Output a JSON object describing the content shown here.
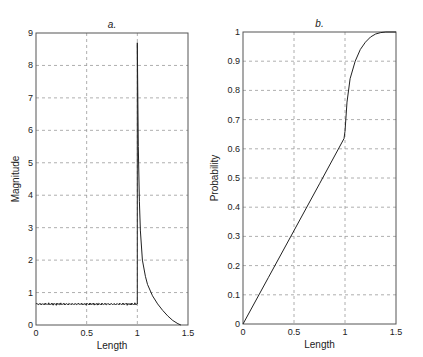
{
  "chart_data": [
    {
      "type": "line",
      "title": "a.",
      "xlabel": "Length",
      "ylabel": "Magnitude",
      "xlim": [
        0,
        1.5
      ],
      "ylim": [
        0,
        9
      ],
      "xticks": [
        "0",
        "0.5",
        "1",
        "1.5"
      ],
      "yticks": [
        "0",
        "1",
        "2",
        "3",
        "4",
        "5",
        "6",
        "7",
        "8",
        "9"
      ],
      "grid": true,
      "series": [
        {
          "name": "magnitude",
          "x": [
            0,
            0.1,
            0.2,
            0.3,
            0.4,
            0.5,
            0.6,
            0.7,
            0.8,
            0.9,
            0.99,
            1.0,
            1.0,
            1.01,
            1.02,
            1.03,
            1.05,
            1.08,
            1.1,
            1.15,
            1.2,
            1.25,
            1.3,
            1.35,
            1.4,
            1.43
          ],
          "y": [
            0.63,
            0.65,
            0.64,
            0.66,
            0.65,
            0.67,
            0.64,
            0.63,
            0.65,
            0.64,
            0.66,
            0.66,
            8.7,
            5.5,
            3.8,
            2.9,
            2.0,
            1.5,
            1.25,
            0.9,
            0.65,
            0.45,
            0.28,
            0.14,
            0.04,
            0.0
          ]
        }
      ]
    },
    {
      "type": "line",
      "title": "b.",
      "xlabel": "Length",
      "ylabel": "Probability",
      "xlim": [
        0,
        1.5
      ],
      "ylim": [
        0,
        1
      ],
      "xticks": [
        "0",
        "0.5",
        "1",
        "1.5"
      ],
      "yticks": [
        "0",
        "0.1",
        "0.2",
        "0.3",
        "0.4",
        "0.5",
        "0.6",
        "0.7",
        "0.8",
        "0.9",
        "1"
      ],
      "grid": true,
      "series": [
        {
          "name": "cumulative probability",
          "x": [
            0,
            0.25,
            0.5,
            0.75,
            0.99,
            1.0,
            1.02,
            1.05,
            1.1,
            1.15,
            1.2,
            1.25,
            1.3,
            1.35,
            1.4,
            1.5
          ],
          "y": [
            0,
            0.16,
            0.32,
            0.48,
            0.635,
            0.66,
            0.76,
            0.84,
            0.9,
            0.94,
            0.965,
            0.983,
            0.993,
            0.998,
            1.0,
            1.0
          ]
        }
      ]
    }
  ]
}
